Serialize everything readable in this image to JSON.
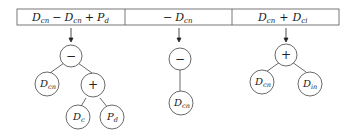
{
  "columns": [
    {
      "expression": {
        "main": "D",
        "parts": [
          {
            "base": "D",
            "sub": "cn"
          },
          {
            "op": "−"
          },
          {
            "base": "D",
            "sub": "cn"
          },
          {
            "op": "+"
          },
          {
            "base": "P",
            "sub": "d"
          }
        ],
        "text": "Dcn − Dcn + Pd"
      },
      "tree": {
        "root": "−",
        "children": [
          {
            "label": "D",
            "sub": "cn"
          },
          {
            "label": "+",
            "children": [
              {
                "label": "D",
                "sub": "c"
              },
              {
                "label": "P",
                "sub": "d"
              }
            ]
          }
        ]
      }
    },
    {
      "expression": {
        "text": "− Dcn"
      },
      "tree": {
        "root": "−",
        "children": [
          {
            "label": "D",
            "sub": "cn"
          }
        ]
      }
    },
    {
      "expression": {
        "text": "Dcn + Dci"
      },
      "tree": {
        "root": "+",
        "children": [
          {
            "label": "D",
            "sub": "cn"
          },
          {
            "label": "D",
            "sub": "in"
          }
        ]
      }
    }
  ],
  "labels": {
    "col1": {
      "t1": "D",
      "s1": "cn",
      "op1": "−",
      "t2": "D",
      "s2": "cn",
      "op2": "+",
      "t3": "P",
      "s3": "d"
    },
    "col2": {
      "op1": "−",
      "t1": "D",
      "s1": "cn"
    },
    "col3": {
      "t1": "D",
      "s1": "cn",
      "op1": "+",
      "t2": "D",
      "s2": "ci"
    },
    "nodes": {
      "c1_root": "−",
      "c1_left": "D",
      "c1_left_sub": "cn",
      "c1_plus": "+",
      "c1_ll": "D",
      "c1_ll_sub": "c",
      "c1_lr": "P",
      "c1_lr_sub": "d",
      "c2_root": "−",
      "c2_child": "D",
      "c2_child_sub": "cn",
      "c3_root": "+",
      "c3_left": "D",
      "c3_left_sub": "cn",
      "c3_right": "D",
      "c3_right_sub": "in"
    }
  }
}
